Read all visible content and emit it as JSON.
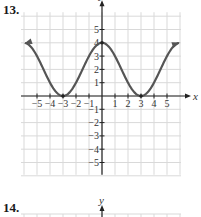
{
  "problems": [
    {
      "number": "13."
    },
    {
      "number": "14."
    }
  ],
  "chart_data": {
    "type": "line",
    "title": "",
    "xlabel": "x",
    "ylabel": "y",
    "xlim": [
      -6,
      6
    ],
    "ylim": [
      -6,
      6
    ],
    "grid": true,
    "x_tick_labels": [
      "-5",
      "-4",
      "-3",
      "-2",
      "-1",
      "1",
      "2",
      "3",
      "4",
      "5"
    ],
    "y_tick_labels": [
      "5",
      "4",
      "3",
      "2",
      "1",
      "-1",
      "-2",
      "-3",
      "-4",
      "-5"
    ],
    "series": [
      {
        "name": "f(x)",
        "x": [
          -6,
          -5,
          -4,
          -3,
          -2,
          -1,
          0,
          1,
          2,
          3,
          4,
          5,
          6
        ],
        "y": [
          4,
          3,
          1,
          0,
          1,
          3,
          4,
          3,
          1,
          0,
          1,
          3,
          4
        ],
        "arrows_at_ends": true,
        "marked_points": [
          [
            -3,
            0
          ],
          [
            0,
            4
          ],
          [
            3,
            0
          ]
        ]
      }
    ],
    "colors": {
      "curve": "#555555",
      "grid": "#d9d9d9",
      "axis": "#222222"
    }
  },
  "second_chart_header": {
    "ylabel": "y"
  }
}
